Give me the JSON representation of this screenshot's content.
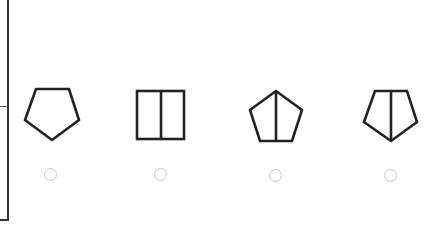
{
  "question": {
    "options": [
      {
        "id": "a",
        "shape": "pentagon-point-down",
        "selected": false
      },
      {
        "id": "b",
        "shape": "rectangle-vertical-divider",
        "selected": false
      },
      {
        "id": "c",
        "shape": "pentagon-point-up-vertical-line",
        "selected": false
      },
      {
        "id": "d",
        "shape": "pentagon-point-down-vertical-line",
        "selected": false
      }
    ]
  },
  "colors": {
    "stroke": "#222222",
    "radio_border": "#c8c8c8",
    "frame": "#333333"
  }
}
